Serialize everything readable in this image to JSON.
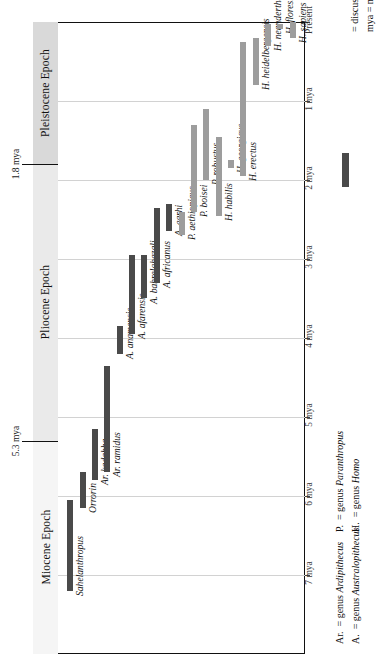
{
  "figure": {
    "orientation": "rotated-90",
    "colors": {
      "discussed_bar": "#4a4a4a",
      "other_bar": "#9d9d9d",
      "gridline": "#d2d2d2",
      "frame": "#111111",
      "epoch_band_light": "#f2f2f2",
      "epoch_band_mid": "#e3e3e3",
      "epoch_band_dark": "#cfcfcf"
    }
  },
  "axis": {
    "label_unit": "mya",
    "ticks": [
      {
        "label": "Present",
        "value": 0
      },
      {
        "label": "1 mya",
        "value": 1
      },
      {
        "label": "2 mya",
        "value": 2
      },
      {
        "label": "3 mya",
        "value": 3
      },
      {
        "label": "4 mya",
        "value": 4
      },
      {
        "label": "5 mya",
        "value": 5
      },
      {
        "label": "6 mya",
        "value": 6
      },
      {
        "label": "7 mya",
        "value": 7
      }
    ],
    "range": [
      0,
      8
    ]
  },
  "epochs": [
    {
      "name": "Pleistocene Epoch",
      "start": 1.8,
      "end": 0
    },
    {
      "name": "Pliocene Epoch",
      "start": 5.3,
      "end": 1.8
    },
    {
      "name": "Miocene Epoch",
      "start": 8.0,
      "end": 5.3
    }
  ],
  "boundaries": [
    {
      "label": "1.8 mya",
      "value": 1.8
    },
    {
      "label": "5.3 mya",
      "value": 5.3
    }
  ],
  "legend_right": {
    "unit_note": "mya = millions of years ago",
    "swatch_note": "= discussed in this volume"
  },
  "legend_bottom": {
    "entries": [
      {
        "abbrev": "Ar.",
        "expansion": "= genus Ardipithecus",
        "genus": "Ardipithecus"
      },
      {
        "abbrev": "A.",
        "expansion": "= genus Australopithecus",
        "genus": "Australopithecus"
      },
      {
        "abbrev": "P.",
        "expansion": "= genus Paranthropus",
        "genus": "Paranthropus"
      },
      {
        "abbrev": "H.",
        "expansion": "= genus Homo",
        "genus": "Homo"
      }
    ]
  },
  "chart_data": {
    "type": "bar",
    "xlabel": "Species",
    "ylabel": "Millions of years ago (mya)",
    "ylim": [
      8,
      0
    ],
    "grid": true,
    "legend_position": "right",
    "orientation": "ranges along vertical time axis",
    "categories": [
      "Sahelanthropus",
      "Orrorin",
      "Ar. kadabba",
      "Ar. ramidus",
      "A. anamensis",
      "A. afarensis",
      "A. bahrelghazali",
      "A. africanus",
      "A. garhi",
      "P. aethiopicus",
      "P. boisei",
      "P. robustus",
      "H. habilis",
      "H. georgicus",
      "H. erectus",
      "H. heidelbergensis",
      "H. neanderthalensis",
      "H. floresiensis",
      "H. sapiens"
    ],
    "series": [
      {
        "name": "Temporal range (mya)",
        "ranges": [
          {
            "species": "Sahelanthropus",
            "start": 7.2,
            "end": 6.05,
            "discussed": true
          },
          {
            "species": "Orrorin",
            "start": 6.15,
            "end": 5.7,
            "discussed": true
          },
          {
            "species": "Ar. kadabba",
            "start": 5.8,
            "end": 5.15,
            "discussed": true
          },
          {
            "species": "Ar. ramidus",
            "start": 5.7,
            "end": 4.35,
            "discussed": true
          },
          {
            "species": "A. anamensis",
            "start": 4.2,
            "end": 3.85,
            "discussed": true
          },
          {
            "species": "A. afarensis",
            "start": 3.95,
            "end": 2.95,
            "discussed": true
          },
          {
            "species": "A. bahrelghazali",
            "start": 3.5,
            "end": 2.95,
            "discussed": true
          },
          {
            "species": "A. africanus",
            "start": 3.3,
            "end": 2.35,
            "discussed": true
          },
          {
            "species": "A. garhi",
            "start": 2.65,
            "end": 2.3,
            "discussed": true
          },
          {
            "species": "P. aethiopicus",
            "start": 2.7,
            "end": 2.4,
            "discussed": false
          },
          {
            "species": "P. boisei",
            "start": 2.4,
            "end": 1.3,
            "discussed": false
          },
          {
            "species": "P. robustus",
            "start": 2.0,
            "end": 1.1,
            "discussed": false
          },
          {
            "species": "H. habilis",
            "start": 2.45,
            "end": 1.45,
            "discussed": false
          },
          {
            "species": "H. georgicus",
            "start": 1.85,
            "end": 1.75,
            "discussed": false
          },
          {
            "species": "H. erectus",
            "start": 1.95,
            "end": 0.25,
            "discussed": false
          },
          {
            "species": "H. heidelbergensis",
            "start": 0.8,
            "end": 0.2,
            "discussed": false
          },
          {
            "species": "H. neanderthalensis",
            "start": 0.3,
            "end": 0.03,
            "discussed": false
          },
          {
            "species": "H. floresiensis",
            "start": 0.09,
            "end": 0.02,
            "discussed": false
          },
          {
            "species": "H. sapiens",
            "start": 0.2,
            "end": 0.0,
            "discussed": false
          }
        ]
      }
    ],
    "epoch_bands": [
      {
        "name": "Pleistocene Epoch",
        "from": 1.8,
        "to": 0.0
      },
      {
        "name": "Pliocene Epoch",
        "from": 5.3,
        "to": 1.8
      },
      {
        "name": "Miocene Epoch",
        "from": 8.0,
        "to": 5.3
      }
    ]
  }
}
